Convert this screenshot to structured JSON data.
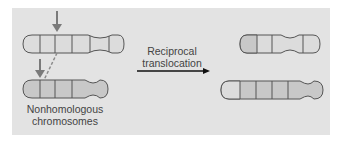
{
  "diagram": {
    "process_label_line1": "Reciprocal",
    "process_label_line2": "translocation",
    "caption_line1": "Nonhomologous",
    "caption_line2": "chromosomes",
    "colors": {
      "panel": "#e3e3e3",
      "chromosome_a": "#dcdcdc",
      "chromosome_b": "#c8c8c8",
      "outline": "#555555",
      "arrow": "#7a7a7a"
    },
    "before": {
      "chromosome_a_segments": 6,
      "chromosome_b_segments": 5,
      "break_markers": 2
    },
    "after": {
      "chromosome_a_segments": 5,
      "chromosome_b_segments": 6
    }
  }
}
